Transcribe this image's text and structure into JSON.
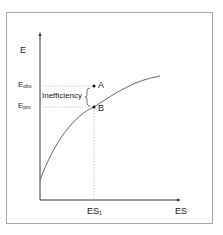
{
  "diagram": {
    "y_axis_label": "E",
    "x_axis_label": "ES",
    "x_tick_label": {
      "main": "ES",
      "sub": "1"
    },
    "y_levels": [
      {
        "main": "E",
        "sub": "obs"
      },
      {
        "main": "E",
        "sub": "pro"
      }
    ],
    "points": [
      {
        "label": "A"
      },
      {
        "label": "B"
      }
    ],
    "bracket_label": "Inefficiency",
    "colors": {
      "axis": "#333333",
      "curve": "#666666",
      "guide": "#b0b0b0",
      "frame": "#a8a8a8"
    }
  }
}
